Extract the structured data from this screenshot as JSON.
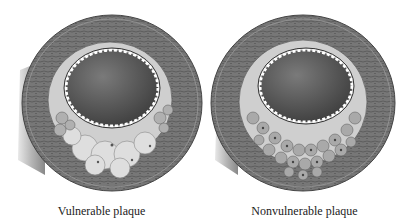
{
  "figure": {
    "panels": [
      {
        "caption": "Vulnerable plaque",
        "type": "vulnerable"
      },
      {
        "caption": "Nonvulnerable plaque",
        "type": "nonvulnerable"
      }
    ]
  },
  "colors": {
    "vessel_wall": "#6e6e6e",
    "wall_texture": "#8a8a8a",
    "intima": "#c9c9c9",
    "lumen": "#5a5a5a",
    "lipid_core": "#d6d6d6",
    "foam_cell": "#a8a8a8",
    "outer_shadow": "#9a9a9a"
  }
}
